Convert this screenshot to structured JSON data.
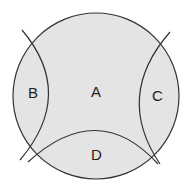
{
  "diagram": {
    "regions": [
      {
        "id": "A",
        "label": "A"
      },
      {
        "id": "B",
        "label": "B"
      },
      {
        "id": "C",
        "label": "C"
      },
      {
        "id": "D",
        "label": "D"
      }
    ],
    "colors": {
      "fill": "#e4e4e4",
      "stroke": "#333333",
      "background": "#ffffff"
    }
  }
}
